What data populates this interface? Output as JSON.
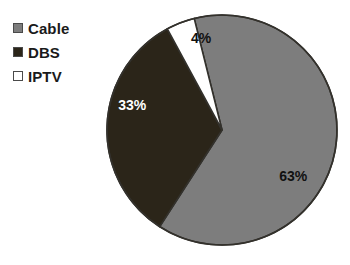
{
  "chart_data": {
    "type": "pie",
    "title": "",
    "categories": [
      "Cable",
      "DBS",
      "IPTV"
    ],
    "values": [
      63,
      33,
      4
    ],
    "value_labels": [
      "63%",
      "33%",
      "4%"
    ],
    "colors": [
      "#7d7d7d",
      "#2b2519",
      "#ffffff"
    ],
    "label_text_colors": [
      "#111111",
      "#ffffff",
      "#111111"
    ],
    "legend_position": "top-left",
    "grid": false,
    "xlabel": "",
    "ylabel": "",
    "start_angle_deg": -14,
    "direction": "clockwise",
    "slices": [
      {
        "name": "Cable",
        "value": 63,
        "label": "63%",
        "color": "#7d7d7d",
        "label_color": "#111111"
      },
      {
        "name": "DBS",
        "value": 33,
        "label": "33%",
        "color": "#2b2519",
        "label_color": "#ffffff"
      },
      {
        "name": "IPTV",
        "value": 4,
        "label": "4%",
        "color": "#ffffff",
        "label_color": "#111111"
      }
    ]
  },
  "legend": {
    "items": [
      {
        "label": "Cable",
        "swatch": "#7d7d7d"
      },
      {
        "label": "DBS",
        "swatch": "#2b2519"
      },
      {
        "label": "IPTV",
        "swatch": "#ffffff"
      }
    ]
  },
  "labels": {
    "cable": "63%",
    "dbs": "33%",
    "iptv": "4%"
  },
  "geometry": {
    "center_x": 222,
    "center_y": 130,
    "radius": 115,
    "outline_color": "#33312c",
    "outline_width": 1.6
  }
}
